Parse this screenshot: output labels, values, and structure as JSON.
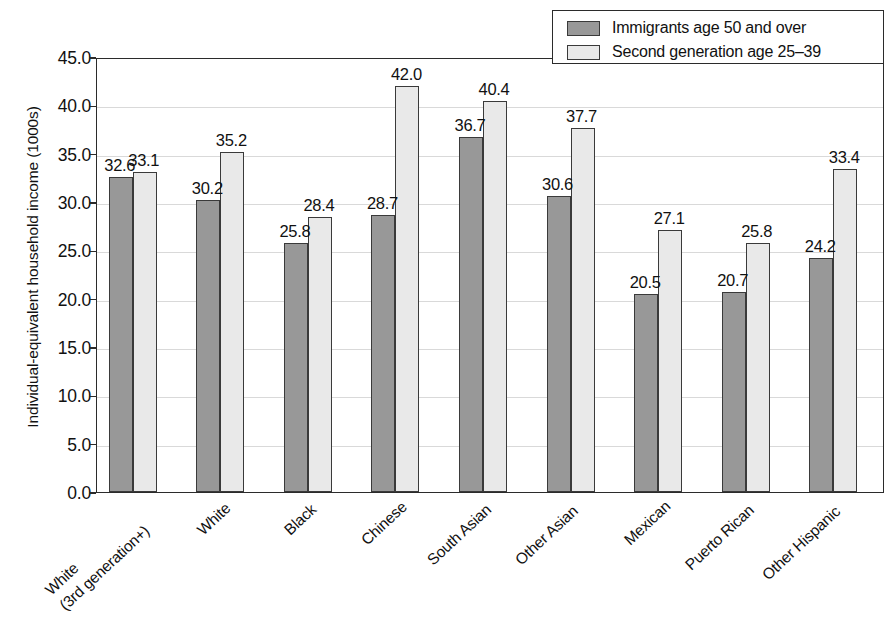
{
  "chart_data": {
    "type": "bar",
    "title": "",
    "xlabel": "",
    "ylabel": "Individual-equivalent household income (1000s)",
    "ylim": [
      0,
      45
    ],
    "ytick_labels": [
      "0.0",
      "5.0",
      "10.0",
      "15.0",
      "20.0",
      "25.0",
      "30.0",
      "35.0",
      "40.0",
      "45.0"
    ],
    "ytick_values": [
      0,
      5,
      10,
      15,
      20,
      25,
      30,
      35,
      40,
      45
    ],
    "grid": true,
    "legend_position": "top-right",
    "categories": [
      "White\n(3rd generation+)",
      "White",
      "Black",
      "Chinese",
      "South Asian",
      "Other Asian",
      "Mexican",
      "Puerto Rican",
      "Other Hispanic"
    ],
    "category_lines": [
      [
        "White",
        "(3rd generation+)"
      ],
      [
        "White"
      ],
      [
        "Black"
      ],
      [
        "Chinese"
      ],
      [
        "South Asian"
      ],
      [
        "Other Asian"
      ],
      [
        "Mexican"
      ],
      [
        "Puerto Rican"
      ],
      [
        "Other Hispanic"
      ]
    ],
    "series": [
      {
        "name": "Immigrants age 50 and over",
        "color": "#989898",
        "values": [
          32.6,
          30.2,
          25.8,
          28.7,
          36.7,
          30.6,
          20.5,
          20.7,
          24.2
        ],
        "labels": [
          "32.6",
          "30.2",
          "25.8",
          "28.7",
          "36.7",
          "30.6",
          "20.5",
          "20.7",
          "24.2"
        ]
      },
      {
        "name": "Second generation age 25–39",
        "color": "#e9e9e9",
        "values": [
          33.1,
          35.2,
          28.4,
          42.0,
          40.4,
          37.7,
          27.1,
          25.8,
          33.4
        ],
        "labels": [
          "33.1",
          "35.2",
          "28.4",
          "42.0",
          "40.4",
          "37.7",
          "27.1",
          "25.8",
          "33.4"
        ]
      }
    ]
  },
  "legend": {
    "items": [
      {
        "label": "Immigrants age 50 and over",
        "swatch": "immigrant"
      },
      {
        "label": "Second generation age 25–39",
        "swatch": "second"
      }
    ]
  }
}
